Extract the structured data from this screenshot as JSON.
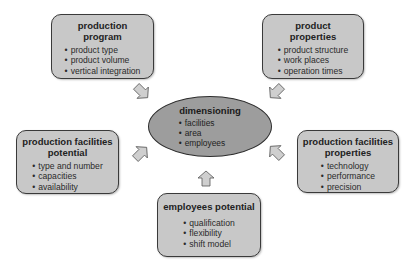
{
  "diagram": {
    "center": {
      "title": "dimensioning",
      "items": [
        "facilities",
        "area",
        "employees"
      ]
    },
    "boxes": [
      {
        "id": "production-program",
        "title_lines": [
          "production",
          "program"
        ],
        "items": [
          "product type",
          "product volume",
          "vertical integration"
        ]
      },
      {
        "id": "product-properties",
        "title_lines": [
          "product",
          "properties"
        ],
        "items": [
          "product structure",
          "work places",
          "operation times"
        ]
      },
      {
        "id": "production-facilities-potential",
        "title_lines": [
          "production facilities",
          "potential"
        ],
        "items": [
          "type and number",
          "capacities",
          "availability"
        ]
      },
      {
        "id": "production-facilities-properties",
        "title_lines": [
          "production facilities",
          "properties"
        ],
        "items": [
          "technology",
          "performance",
          "precision"
        ]
      },
      {
        "id": "employees-potential",
        "title_lines": [
          "employees potential"
        ],
        "items": [
          "qualification",
          "flexibility",
          "shift model"
        ]
      }
    ],
    "arrows": [
      {
        "from": "production-program",
        "to": "dimensioning",
        "direction": "down-right"
      },
      {
        "from": "product-properties",
        "to": "dimensioning",
        "direction": "down-left"
      },
      {
        "from": "production-facilities-potential",
        "to": "dimensioning",
        "direction": "up-right"
      },
      {
        "from": "production-facilities-properties",
        "to": "dimensioning",
        "direction": "up-left"
      },
      {
        "from": "employees-potential",
        "to": "dimensioning",
        "direction": "up"
      }
    ],
    "colors": {
      "box_fill": "#c8c8c8",
      "ellipse_fill": "#9d9d9d",
      "border": "#3a3a3a",
      "arrow_fill": "#cfcfcf"
    }
  }
}
